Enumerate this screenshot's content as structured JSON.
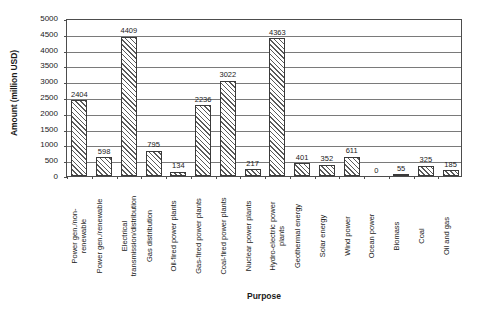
{
  "chart_data": {
    "type": "bar",
    "title": "",
    "xlabel": "Purpose",
    "ylabel": "Amount (million USD)",
    "ylim": [
      0,
      5000
    ],
    "ytick_step": 500,
    "yticks": [
      "0",
      "500",
      "1000",
      "1500",
      "2000",
      "2500",
      "3000",
      "3500",
      "4000",
      "4500",
      "5000"
    ],
    "grid": true,
    "legend": "none",
    "categories": [
      "Power gen./non-renewable",
      "Power gen./renewable",
      "Electrical transmission/distribution",
      "Gas distribution",
      "Oil-fired power plants",
      "Gas-fired power plants",
      "Coal-fired power plants",
      "Nuclear power plants",
      "Hydro-electric power plants",
      "Geothermal energy",
      "Solar energy",
      "Wind power",
      "Ocean power",
      "Biomass",
      "Coal",
      "Oil and gas"
    ],
    "category_lines": [
      "Power gen./non-\nrenewable",
      "Power gen./renewable",
      "Electrical\ntransmission/distribution",
      "Gas distribution",
      "Oil-fired power plants",
      "Gas-fired power plants",
      "Coal-fired power plants",
      "Nuclear power plants",
      "Hydro-electric power\nplants",
      "Geothermal energy",
      "Solar energy",
      "Wind power",
      "Ocean power",
      "Biomass",
      "Coal",
      "Oil and gas"
    ],
    "values": [
      2404,
      598,
      4409,
      795,
      134,
      2236,
      3022,
      217,
      4363,
      401,
      352,
      611,
      0,
      55,
      325,
      185
    ],
    "value_labels": [
      "2404",
      "598",
      "4409",
      "795",
      "134",
      "2236",
      "3022",
      "217",
      "4363",
      "401",
      "352",
      "611",
      "0",
      "55",
      "325",
      "185"
    ]
  },
  "colors": {
    "bar_outline": "#3a3a3a",
    "bar_hatch": "#5a5a5a",
    "grid": "#7a7a7a",
    "frame": "#4d4d4d",
    "text": "#1a1a1a",
    "background": "#ffffff"
  }
}
